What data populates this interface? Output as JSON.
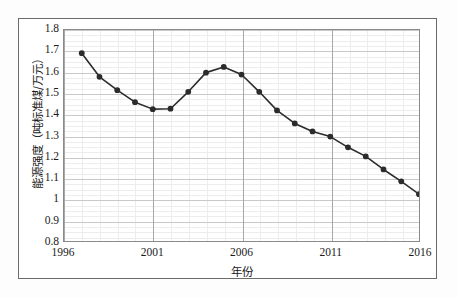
{
  "chart_data": {
    "type": "line",
    "title": "",
    "xlabel": "年份",
    "ylabel": "能源强度（吨标准煤/万元）",
    "xlim": [
      1996,
      2016
    ],
    "ylim": [
      0.8,
      1.8
    ],
    "grid": true,
    "legend": "none",
    "marker": "filled-circle",
    "line_color": "#2b2b2b",
    "marker_color": "#2b2b2b",
    "x": [
      1997,
      1998,
      1999,
      2000,
      2001,
      2002,
      2003,
      2004,
      2005,
      2006,
      2007,
      2008,
      2009,
      2010,
      2011,
      2012,
      2013,
      2014,
      2015,
      2016
    ],
    "values": [
      1.69,
      1.578,
      1.515,
      1.458,
      1.425,
      1.427,
      1.507,
      1.598,
      1.625,
      1.589,
      1.507,
      1.419,
      1.357,
      1.319,
      1.295,
      1.244,
      1.201,
      1.139,
      1.083,
      1.022
    ],
    "series": [
      {
        "name": "能源强度",
        "values": [
          1.69,
          1.578,
          1.515,
          1.458,
          1.425,
          1.427,
          1.507,
          1.598,
          1.625,
          1.589,
          1.507,
          1.419,
          1.357,
          1.319,
          1.295,
          1.244,
          1.201,
          1.139,
          1.083,
          1.022
        ]
      }
    ],
    "xticks": [
      1996,
      2001,
      2006,
      2011,
      2016
    ],
    "xticklabels": [
      "1996",
      "2001",
      "2006",
      "2011",
      "2016"
    ],
    "yticks": [
      0.8,
      0.9,
      1.0,
      1.1,
      1.2,
      1.3,
      1.4,
      1.5,
      1.6,
      1.7,
      1.8
    ],
    "yticklabels": [
      "0.8",
      "0.9",
      "1",
      "1.1",
      "1.2",
      "1.3",
      "1.4",
      "1.5",
      "1.6",
      "1.7",
      "1.8"
    ],
    "y_minor_step": 0.025,
    "x_minor_step": 1
  }
}
